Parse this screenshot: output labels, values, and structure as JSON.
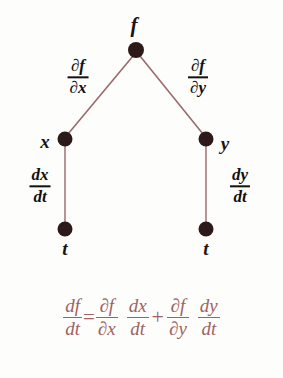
{
  "figure": {
    "kind": "chain-rule-tree-diagram",
    "background_color": "#fdfdfc",
    "node_color": "#2b1a17",
    "edge_color": "#9b6b6b",
    "label_color": "#131010",
    "equation_color": "#9c6363"
  },
  "tree": {
    "root": {
      "label": "f",
      "dot": {
        "x": 136,
        "y": 50
      },
      "label_pos": {
        "x": 134,
        "y": 25
      }
    },
    "level1": [
      {
        "name": "node-x",
        "label": "x",
        "dot": {
          "x": 65,
          "y": 139
        },
        "label_pos": {
          "x": 45,
          "y": 141
        }
      },
      {
        "name": "node-y",
        "label": "y",
        "dot": {
          "x": 206,
          "y": 139
        },
        "label_pos": {
          "x": 225,
          "y": 143
        }
      }
    ],
    "level2": [
      {
        "name": "node-t-left",
        "label": "t",
        "dot": {
          "x": 65,
          "y": 229
        },
        "label_pos": {
          "x": 65,
          "y": 248
        }
      },
      {
        "name": "node-t-right",
        "label": "t",
        "dot": {
          "x": 206,
          "y": 229
        },
        "label_pos": {
          "x": 206,
          "y": 248
        }
      }
    ],
    "edges": [
      {
        "name": "edge-f-to-x",
        "from": "f",
        "to": "x",
        "x1": 133,
        "y1": 56,
        "x2": 68,
        "y2": 134
      },
      {
        "name": "edge-f-to-y",
        "from": "f",
        "to": "y",
        "x1": 140,
        "y1": 56,
        "x2": 203,
        "y2": 134
      },
      {
        "name": "edge-x-to-t",
        "from": "x",
        "to": "t",
        "x1": 65,
        "y1": 143,
        "x2": 65,
        "y2": 226
      },
      {
        "name": "edge-y-to-t",
        "from": "y",
        "to": "t",
        "x1": 206,
        "y1": 143,
        "x2": 206,
        "y2": 226
      }
    ],
    "edge_labels": [
      {
        "name": "edge-label-df-dx",
        "numerator": "∂f",
        "denominator": "∂x",
        "pos": {
          "x": 78,
          "y": 77
        }
      },
      {
        "name": "edge-label-df-dy",
        "numerator": "∂f",
        "denominator": "∂y",
        "pos": {
          "x": 198,
          "y": 77
        }
      },
      {
        "name": "edge-label-dx-dt",
        "numerator": "dx",
        "denominator": "dt",
        "pos": {
          "x": 40,
          "y": 186
        }
      },
      {
        "name": "edge-label-dy-dt",
        "numerator": "dy",
        "denominator": "dt",
        "pos": {
          "x": 240,
          "y": 186
        }
      }
    ]
  },
  "equation": {
    "full_text": "df/dt = ∂f/∂x dx/dt + ∂f/∂y dy/dt",
    "terms": [
      {
        "name": "term-df-dt",
        "numerator": "df",
        "denominator": "dt"
      },
      {
        "name": "operator-equals",
        "symbol": "="
      },
      {
        "name": "term-pdf-pdx",
        "numerator": "∂f",
        "denominator": "∂x"
      },
      {
        "name": "term-dx-dt",
        "numerator": "dx",
        "denominator": "dt"
      },
      {
        "name": "operator-plus",
        "symbol": "+"
      },
      {
        "name": "term-pdf-pdy",
        "numerator": "∂f",
        "denominator": "∂y"
      },
      {
        "name": "term-dy-dt",
        "numerator": "dy",
        "denominator": "dt"
      }
    ]
  }
}
